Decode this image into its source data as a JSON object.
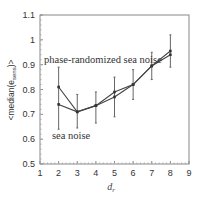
{
  "chart_data": {
    "type": "line",
    "title": "",
    "xlabel": "d_r",
    "ylabel": "<median(e_sens)>",
    "xlim": [
      1,
      9
    ],
    "ylim": [
      0.5,
      1.1
    ],
    "xticks": [
      "1",
      "2",
      "3",
      "4",
      "5",
      "6",
      "7",
      "8",
      "9"
    ],
    "yticks": [
      "0.5",
      "0.6",
      "0.7",
      "0.8",
      "0.9",
      "1",
      "1.1"
    ],
    "grid": false,
    "x": [
      2,
      3,
      4,
      5,
      6,
      7,
      8
    ],
    "series": [
      {
        "name": "phase-randomized sea noise",
        "values": [
          0.81,
          0.71,
          0.735,
          0.79,
          0.82,
          0.895,
          0.955
        ],
        "err_low": [
          0.64,
          0.645,
          0.665,
          0.69,
          0.76,
          0.84,
          0.89
        ],
        "err_high": [
          0.89,
          0.78,
          0.79,
          0.85,
          0.88,
          0.95,
          1.02
        ]
      },
      {
        "name": "sea noise",
        "values": [
          0.74,
          0.71,
          0.735,
          0.77,
          0.82,
          0.895,
          0.94
        ],
        "err_low": [
          0.64,
          0.645,
          0.665,
          0.69,
          0.76,
          0.84,
          0.89
        ],
        "err_high": [
          0.89,
          0.78,
          0.79,
          0.85,
          0.88,
          0.95,
          1.02
        ]
      }
    ],
    "annotations": [
      {
        "text": "phase-randomized sea noise",
        "x": 2.1,
        "y": 0.88
      },
      {
        "text": "sea noise",
        "x": 1.7,
        "y": 0.61
      }
    ]
  },
  "labels": {
    "xlabel": "d",
    "xlabel_sub": "r",
    "ylabel": "<median(e",
    "ylabel_sub": "sens",
    "ylabel_end": ")>"
  }
}
